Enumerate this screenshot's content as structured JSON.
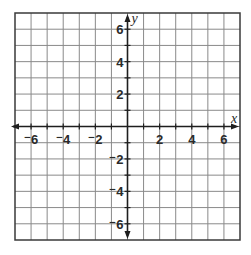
{
  "chart_data": {
    "type": "coordinate-grid",
    "title": "",
    "xlabel": "x",
    "ylabel": "y",
    "xlim": [
      -7,
      7
    ],
    "ylim": [
      -7,
      7
    ],
    "grid": true,
    "grid_step": 1,
    "x_ticks": [
      -6,
      -4,
      -2,
      2,
      4,
      6
    ],
    "y_ticks": [
      -6,
      -4,
      -2,
      2,
      4,
      6
    ],
    "x_tick_labels": [
      "⁻6",
      "⁻4",
      "⁻2",
      "2",
      "4",
      "6"
    ],
    "y_tick_labels": [
      "⁻6",
      "⁻4",
      "⁻2",
      "2",
      "4",
      "6"
    ],
    "series": []
  },
  "layout": {
    "left": 15,
    "top": 13,
    "right": 240,
    "bottom": 240,
    "origin_x": 128,
    "origin_y": 126
  },
  "colors": {
    "grid": "#8a8a8a",
    "axis": "#1e1e1e",
    "text": "#2a2a2a"
  }
}
